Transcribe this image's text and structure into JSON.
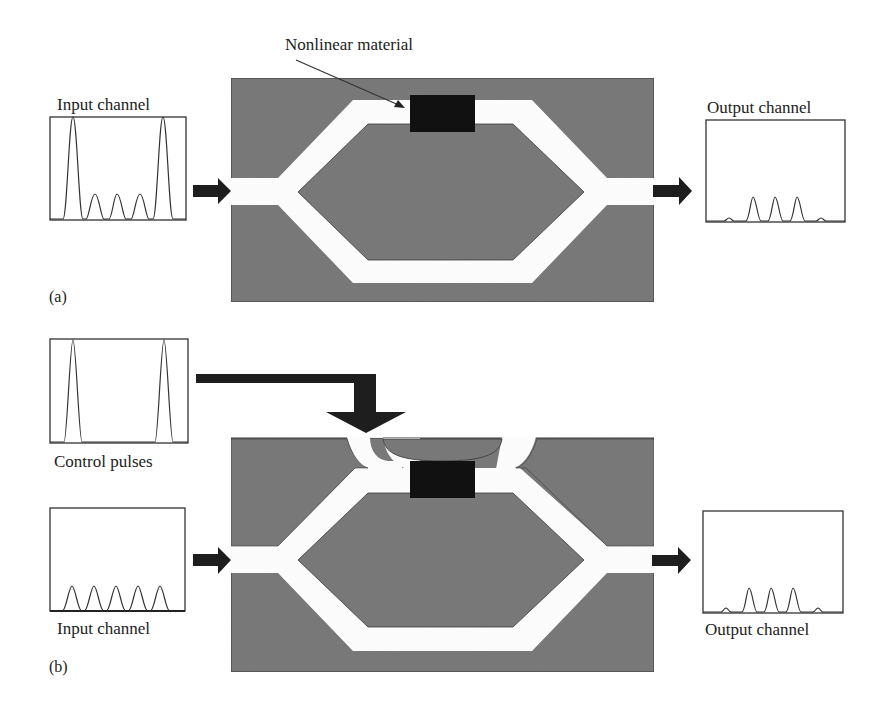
{
  "figure": {
    "panels": [
      {
        "id": "a",
        "label": "(a)",
        "input": {
          "label": "Input channel",
          "pulses": "2 tall pulses at ends with 3 small pulses between"
        },
        "device": {
          "annotation": "Nonlinear material"
        },
        "output": {
          "label": "Output channel",
          "pulses": "3 medium pulses with 2 tiny side pulses"
        }
      },
      {
        "id": "b",
        "label": "(b)",
        "control": {
          "label": "Control pulses",
          "pulses": "2 tall narrow pulses at ends"
        },
        "input": {
          "label": "Input channel",
          "pulses": "5 equal small pulses"
        },
        "output": {
          "label": "Output channel",
          "pulses": "3 medium pulses with 2 tiny side pulses"
        }
      }
    ],
    "colors": {
      "substrate": "#7a7a7a",
      "waveguide": "#ffffff",
      "nonlinear_material": "#111111",
      "arrow": "#1e1e1e",
      "frame": "#333333"
    }
  }
}
